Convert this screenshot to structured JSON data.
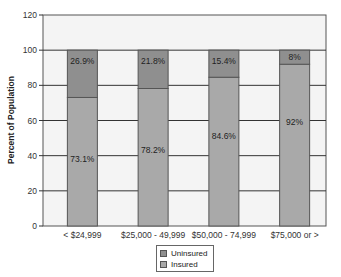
{
  "chart_data": {
    "type": "bar",
    "stacked": true,
    "title": "",
    "xlabel": "",
    "ylabel": "Percent of Population",
    "ylim": [
      0,
      120
    ],
    "yticks": [
      0,
      20,
      40,
      60,
      80,
      100,
      120
    ],
    "grid": true,
    "legend_position": "bottom-center",
    "categories": [
      "< $24,999",
      "$25,000 - 49,999",
      "$50,000 - 74,999",
      "$75,000 or >"
    ],
    "series": [
      {
        "name": "Insured",
        "values": [
          73.1,
          78.2,
          84.6,
          92
        ],
        "labels": [
          "73.1%",
          "78.2%",
          "84.6%",
          "92%"
        ],
        "color": "#a9a9a9"
      },
      {
        "name": "Uninsured",
        "values": [
          26.9,
          21.8,
          15.4,
          8
        ],
        "labels": [
          "26.9%",
          "21.8%",
          "15.4%",
          "8%"
        ],
        "color": "#8f8f8f"
      }
    ]
  },
  "legend": {
    "items": [
      {
        "label": "Uninsured",
        "color": "#8f8f8f"
      },
      {
        "label": "Insured",
        "color": "#a9a9a9"
      }
    ]
  },
  "colors": {
    "plot_bg": "#f4f4f4",
    "grid": "#333333",
    "bar_border": "#555555"
  }
}
